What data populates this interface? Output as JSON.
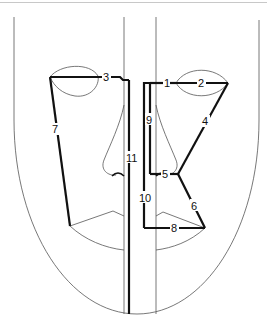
{
  "figure": {
    "segments": [
      {
        "id": "1",
        "label": "1"
      },
      {
        "id": "2",
        "label": "2"
      },
      {
        "id": "3",
        "label": "3"
      },
      {
        "id": "4",
        "label": "4"
      },
      {
        "id": "5",
        "label": "5"
      },
      {
        "id": "6",
        "label": "6"
      },
      {
        "id": "7",
        "label": "7"
      },
      {
        "id": "8",
        "label": "8"
      },
      {
        "id": "9",
        "label": "9"
      },
      {
        "id": "10",
        "label": "10"
      },
      {
        "id": "11",
        "label": "11"
      }
    ]
  }
}
